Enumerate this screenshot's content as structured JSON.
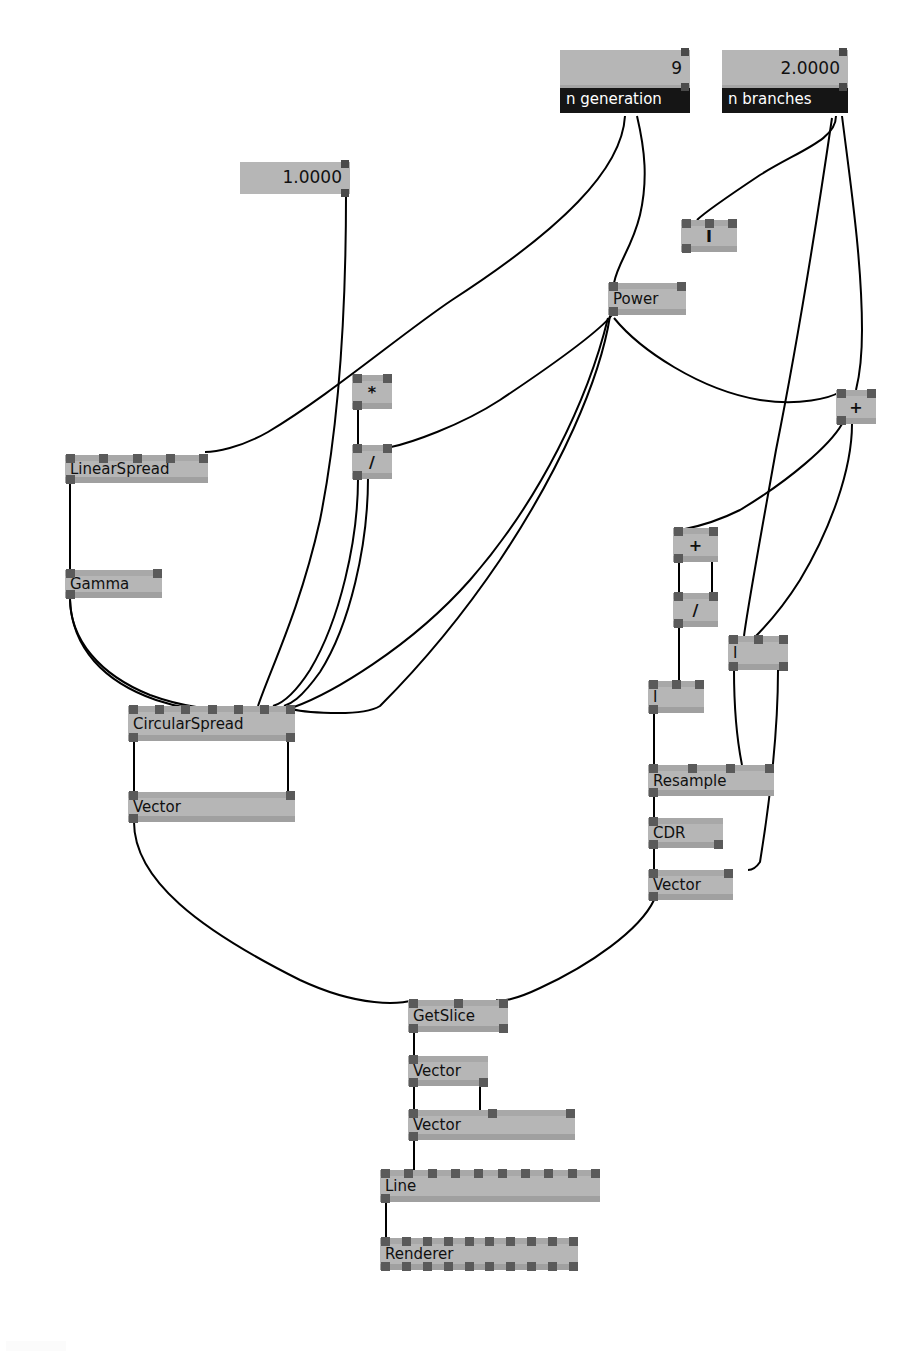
{
  "app": {
    "title": "Node Graph Editor",
    "canvas_width": 923,
    "canvas_height": 1353,
    "background": "#ffffff",
    "node_fill": "#b6b6b6",
    "node_band": "#a0a0a0",
    "port_color": "#5a5a5a",
    "title_bar_color": "#151515",
    "title_text_color": "#ffffff",
    "wire_color": "#000000"
  },
  "parameters": [
    {
      "id": "param-n-generation",
      "name": "n generation",
      "value": "9",
      "x": 560,
      "y": 50,
      "width": 130,
      "field_height": 38,
      "title_height": 25
    },
    {
      "id": "param-n-branches",
      "name": "n branches",
      "value": "2.0000",
      "x": 722,
      "y": 50,
      "width": 126,
      "field_height": 38,
      "title_height": 25
    },
    {
      "id": "param-constant-one",
      "name": "",
      "value": "1.0000",
      "x": 240,
      "y": 162,
      "width": 110,
      "field_height": 32,
      "title_height": 0
    }
  ],
  "nodes": [
    {
      "id": "node-i-top",
      "label": "I",
      "x": 681,
      "y": 220,
      "w": 56,
      "h": 32,
      "center": true,
      "top_ports": 3,
      "bot_ports": 1,
      "connected_top": [
        0,
        1,
        2
      ],
      "connected_bot": [
        0
      ]
    },
    {
      "id": "node-power",
      "label": "Power",
      "x": 608,
      "y": 283,
      "w": 78,
      "h": 32,
      "center": false,
      "top_ports": 2,
      "bot_ports": 1,
      "connected_top": [
        0,
        1
      ],
      "connected_bot": [
        0
      ]
    },
    {
      "id": "node-multiply",
      "label": "*",
      "x": 352,
      "y": 375,
      "w": 40,
      "h": 34,
      "center": true,
      "top_ports": 2,
      "bot_ports": 1,
      "connected_top": [
        0,
        1
      ],
      "connected_bot": [
        0
      ]
    },
    {
      "id": "node-divide",
      "label": "/",
      "x": 352,
      "y": 445,
      "w": 40,
      "h": 34,
      "center": true,
      "top_ports": 2,
      "bot_ports": 1,
      "connected_top": [
        0,
        1
      ],
      "connected_bot": [
        0
      ]
    },
    {
      "id": "node-plus-right",
      "label": "+",
      "x": 836,
      "y": 390,
      "w": 40,
      "h": 34,
      "center": true,
      "top_ports": 2,
      "bot_ports": 1,
      "connected_top": [
        0,
        1
      ],
      "connected_bot": [
        0
      ]
    },
    {
      "id": "node-linearspread",
      "label": "LinearSpread",
      "x": 65,
      "y": 455,
      "w": 143,
      "h": 28,
      "center": false,
      "top_ports": 5,
      "bot_ports": 1,
      "connected_top": [
        4
      ],
      "connected_bot": [
        0
      ]
    },
    {
      "id": "node-gamma",
      "label": "Gamma",
      "x": 65,
      "y": 570,
      "w": 97,
      "h": 28,
      "center": false,
      "top_ports": 2,
      "bot_ports": 1,
      "connected_top": [
        0
      ],
      "connected_bot": [
        0
      ]
    },
    {
      "id": "node-plus-mid",
      "label": "+",
      "x": 673,
      "y": 528,
      "w": 45,
      "h": 34,
      "center": true,
      "top_ports": 2,
      "bot_ports": 1,
      "connected_top": [
        0,
        1
      ],
      "connected_bot": [
        0
      ]
    },
    {
      "id": "node-divide-mid",
      "label": "/",
      "x": 673,
      "y": 593,
      "w": 45,
      "h": 34,
      "center": true,
      "top_ports": 2,
      "bot_ports": 1,
      "connected_top": [
        0,
        1
      ],
      "connected_bot": [
        0
      ]
    },
    {
      "id": "node-i-right",
      "label": "I",
      "x": 728,
      "y": 636,
      "w": 60,
      "h": 34,
      "center": false,
      "top_ports": 3,
      "bot_ports": 2,
      "connected_top": [
        1
      ],
      "connected_bot": [
        0,
        1
      ]
    },
    {
      "id": "node-i-left",
      "label": "I",
      "x": 648,
      "y": 681,
      "w": 56,
      "h": 32,
      "center": false,
      "top_ports": 3,
      "bot_ports": 1,
      "connected_top": [
        1
      ],
      "connected_bot": [
        0
      ]
    },
    {
      "id": "node-circularspread",
      "label": "CircularSpread",
      "x": 128,
      "y": 706,
      "w": 167,
      "h": 35,
      "center": false,
      "top_ports": 7,
      "bot_ports": 2,
      "connected_top": [
        2,
        3,
        4,
        5,
        6
      ],
      "connected_bot": [
        0,
        1
      ]
    },
    {
      "id": "node-resample",
      "label": "Resample",
      "x": 648,
      "y": 765,
      "w": 126,
      "h": 31,
      "center": false,
      "top_ports": 4,
      "bot_ports": 1,
      "connected_top": [
        0,
        3
      ],
      "connected_bot": [
        0
      ]
    },
    {
      "id": "node-vector-left",
      "label": "Vector",
      "x": 128,
      "y": 792,
      "w": 167,
      "h": 30,
      "center": false,
      "top_ports": 2,
      "bot_ports": 1,
      "connected_top": [
        0,
        1
      ],
      "connected_bot": [
        0
      ]
    },
    {
      "id": "node-cdr",
      "label": "CDR",
      "x": 648,
      "y": 818,
      "w": 75,
      "h": 30,
      "center": false,
      "top_ports": 1,
      "bot_ports": 2,
      "connected_top": [
        0
      ],
      "connected_bot": [
        0
      ]
    },
    {
      "id": "node-vector-right",
      "label": "Vector",
      "x": 648,
      "y": 870,
      "w": 85,
      "h": 30,
      "center": false,
      "top_ports": 2,
      "bot_ports": 1,
      "connected_top": [
        0,
        1
      ],
      "connected_bot": [
        0
      ]
    },
    {
      "id": "node-getslice",
      "label": "GetSlice",
      "x": 408,
      "y": 1000,
      "w": 100,
      "h": 32,
      "center": false,
      "top_ports": 3,
      "bot_ports": 2,
      "connected_top": [
        0,
        2
      ],
      "connected_bot": [
        0
      ]
    },
    {
      "id": "node-vector-a",
      "label": "Vector",
      "x": 408,
      "y": 1056,
      "w": 80,
      "h": 30,
      "center": false,
      "top_ports": 1,
      "bot_ports": 2,
      "connected_top": [
        0
      ],
      "connected_bot": [
        0,
        1
      ]
    },
    {
      "id": "node-vector-b",
      "label": "Vector",
      "x": 408,
      "y": 1110,
      "w": 167,
      "h": 30,
      "center": false,
      "top_ports": 3,
      "bot_ports": 1,
      "connected_top": [
        0,
        1
      ],
      "connected_bot": [
        0
      ]
    },
    {
      "id": "node-line",
      "label": "Line",
      "x": 380,
      "y": 1170,
      "w": 220,
      "h": 32,
      "center": false,
      "top_ports": 10,
      "bot_ports": 1,
      "connected_top": [
        1
      ],
      "connected_bot": [
        0
      ]
    },
    {
      "id": "node-renderer",
      "label": "Renderer",
      "x": 380,
      "y": 1238,
      "w": 198,
      "h": 32,
      "center": false,
      "top_ports": 10,
      "bot_ports": 10,
      "connected_top": [
        0
      ],
      "connected_bot": []
    }
  ],
  "wires": [
    {
      "from": "param-n-generation",
      "to": "node-multiply",
      "path": "M 625 116 C 622 170, 560 230, 452 300 C 400 335, 330 395, 268 432 C 240 448, 215 452, 205 452"
    },
    {
      "from": "param-n-generation",
      "to": "node-power",
      "path": "M 637 116 C 645 150, 648 180, 640 215 C 632 248, 618 262, 614 283"
    },
    {
      "from": "param-n-branches",
      "to": "node-i-top",
      "path": "M 836 116 C 836 140, 800 150, 760 175 C 730 195, 705 212, 697 220"
    },
    {
      "from": "param-n-branches",
      "to": "node-plus-right",
      "path": "M 842 116 C 850 180, 862 260, 862 330 C 862 365, 858 382, 856 390"
    },
    {
      "from": "param-n-branches",
      "to": "node-i-right",
      "path": "M 832 118 C 820 200, 800 330, 776 450 C 760 540, 748 605, 744 636"
    },
    {
      "from": "param-constant-one",
      "to": "node-circularspread",
      "path": "M 346 196 C 346 300, 340 420, 320 520 C 300 610, 270 670, 258 706"
    },
    {
      "from": "node-power",
      "to": "node-divide",
      "path": "M 612 315 C 600 330, 560 360, 500 400 C 460 426, 410 443, 391 447"
    },
    {
      "from": "node-power",
      "to": "node-circularspread",
      "path": "M 610 316 C 600 380, 560 470, 500 560 C 450 634, 400 686, 380 706 C 360 718, 300 712, 288 708"
    },
    {
      "from": "node-power",
      "to": "node-plus-right",
      "path": "M 614 318 C 640 350, 700 390, 760 400 C 800 406, 830 398, 840 392"
    },
    {
      "from": "node-power",
      "to": "node-circularspread2",
      "path": "M 608 318 C 588 400, 540 500, 470 580 C 410 648, 330 694, 294 707"
    },
    {
      "from": "node-multiply",
      "to": "node-divide",
      "path": "M 358 409 L 358 445"
    },
    {
      "from": "node-divide",
      "to": "node-circularspread",
      "path": "M 358 479 C 358 540, 340 620, 310 670 C 292 698, 280 704, 273 706"
    },
    {
      "from": "node-divide-out2",
      "to": "node-circularspread",
      "path": "M 368 478 C 368 545, 350 625, 320 672 C 300 700, 290 704, 284 706"
    },
    {
      "from": "node-linearspread",
      "to": "node-gamma",
      "path": "M 70 483 L 70 570"
    },
    {
      "from": "node-gamma",
      "to": "node-circularspread",
      "path": "M 70 598 C 70 640, 100 675, 150 695 C 185 708, 215 710, 232 708"
    },
    {
      "from": "node-gamma",
      "to": "node-circularspread2",
      "path": "M 70 600 C 72 648, 104 682, 156 700 C 192 712, 222 712, 240 710"
    },
    {
      "from": "node-plus-right",
      "to": "node-plus-mid",
      "path": "M 842 424 C 830 445, 790 480, 740 510 C 710 525, 690 528, 680 530"
    },
    {
      "from": "node-plus-right",
      "to": "node-i-right",
      "path": "M 852 424 C 852 470, 830 530, 800 580 C 780 612, 762 630, 754 638"
    },
    {
      "from": "node-plus-mid",
      "to": "node-divide-mid",
      "path": "M 679 562 L 679 593"
    },
    {
      "from": "node-plus-mid-out",
      "to": "node-divide-mid2",
      "path": "M 712 562 L 712 593"
    },
    {
      "from": "node-divide-mid",
      "to": "node-i-left",
      "path": "M 679 627 L 679 681"
    },
    {
      "from": "node-i-left",
      "to": "node-resample",
      "path": "M 654 713 L 654 765"
    },
    {
      "from": "node-i-right",
      "to": "node-resample",
      "path": "M 734 670 C 734 710, 738 745, 742 765"
    },
    {
      "from": "node-i-right2",
      "to": "node-vector-right",
      "path": "M 778 670 C 778 730, 770 800, 760 862 C 756 868, 752 870, 748 870"
    },
    {
      "from": "node-circularspread",
      "to": "node-vector-left",
      "path": "M 134 741 L 134 792 M 288 741 L 288 792"
    },
    {
      "from": "node-resample",
      "to": "node-cdr",
      "path": "M 654 796 L 654 818"
    },
    {
      "from": "node-cdr",
      "to": "node-vector-right",
      "path": "M 654 848 L 654 870"
    },
    {
      "from": "node-vector-left",
      "to": "node-getslice",
      "path": "M 134 822 C 134 880, 200 930, 300 980 C 360 1008, 400 1004, 414 1000"
    },
    {
      "from": "node-vector-right",
      "to": "node-getslice",
      "path": "M 654 900 C 640 930, 590 965, 540 988 C 515 1000, 500 1002, 496 1000"
    },
    {
      "from": "node-getslice",
      "to": "node-vector-a",
      "path": "M 414 1032 L 414 1056"
    },
    {
      "from": "node-vector-a",
      "to": "node-vector-b",
      "path": "M 414 1086 L 414 1110 M 480 1086 L 480 1110"
    },
    {
      "from": "node-vector-b",
      "to": "node-line",
      "path": "M 414 1140 L 414 1170"
    },
    {
      "from": "node-line",
      "to": "node-renderer",
      "path": "M 386 1202 L 386 1238"
    }
  ]
}
